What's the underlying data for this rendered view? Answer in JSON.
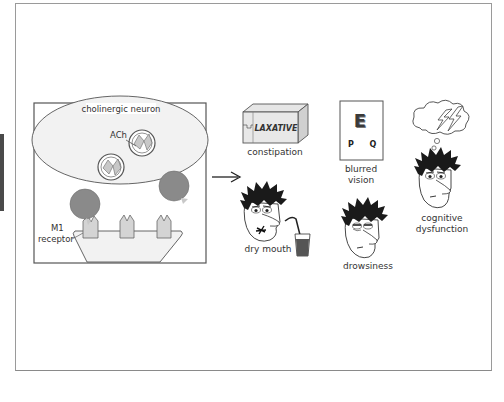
{
  "diagram": {
    "mechanism_panel": {
      "neuron_label": "cholinergic neuron",
      "neurotransmitter_label": "ACh",
      "receptor_label_line1": "M1",
      "receptor_label_line2": "receptor"
    },
    "effects": [
      {
        "id": "constipation",
        "label": "constipation",
        "prop_text": "LAXATIVE"
      },
      {
        "id": "blurred-vision",
        "label_line1": "blurred",
        "label_line2": "vision",
        "chart_letters": [
          "E",
          "P",
          "Q"
        ]
      },
      {
        "id": "cognitive-dysfunction",
        "label_line1": "cognitive",
        "label_line2": "dysfunction"
      },
      {
        "id": "dry-mouth",
        "label": "dry mouth"
      },
      {
        "id": "drowsiness",
        "label": "drowsiness"
      }
    ],
    "colors": {
      "antagonist": "#8a8a8a",
      "receptor": "#d4d4d4",
      "vesicle_fill": "#c8c8c8",
      "neuron_fill": "#f2f2f2",
      "membrane_fill": "#f2f2f2",
      "hair": "#1a1a1a",
      "frame": "#9a9a9a"
    }
  }
}
